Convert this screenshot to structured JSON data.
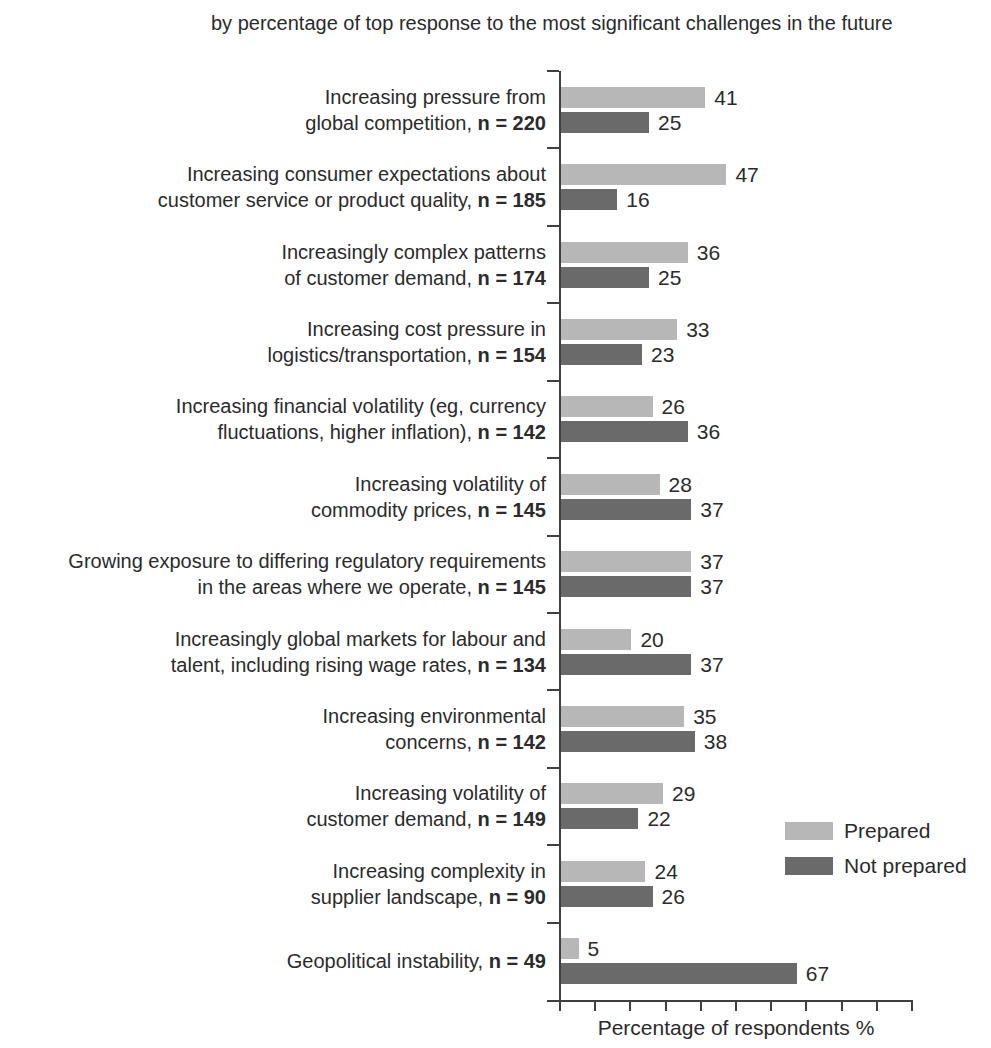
{
  "colors": {
    "axis": "#3f3f3f",
    "text": "#2b2b2b",
    "background": "#ffffff"
  },
  "chart_data": {
    "type": "bar",
    "orientation": "horizontal",
    "subtitle": "by percentage of top response to the most significant challenges in the future",
    "xlabel": "Percentage of respondents %",
    "xlim": [
      0,
      100
    ],
    "x_tick_interval": 10,
    "grid": false,
    "legend_position": "right-bottom",
    "categories": [
      "Increasing pressure from global competition, n = 220",
      "Increasing consumer expectations about customer service or product quality, n = 185",
      "Increasingly complex patterns of customer demand, n = 174",
      "Increasing cost pressure in logistics/transportation, n = 154",
      "Increasing financial volatility (eg, currency fluctuations, higher inflation), n = 142",
      "Increasing volatility of commodity prices, n = 145",
      "Growing exposure to differing regulatory requirements in the areas where we operate, n = 145",
      "Increasingly global markets for labour and talent, including rising wage rates, n = 134",
      "Increasing environmental concerns, n = 142",
      "Increasing volatility of customer demand, n = 149",
      "Increasing complexity in supplier landscape, n = 90",
      "Geopolitical instability, n = 49"
    ],
    "category_lines": [
      {
        "lines": [
          "Increasing pressure from",
          "global competition,"
        ],
        "n": "n = 220"
      },
      {
        "lines": [
          "Increasing consumer expectations about",
          "customer service or product quality,"
        ],
        "n": "n = 185"
      },
      {
        "lines": [
          "Increasingly complex patterns",
          "of customer demand,"
        ],
        "n": "n = 174"
      },
      {
        "lines": [
          "Increasing cost pressure in",
          "logistics/transportation,"
        ],
        "n": "n = 154"
      },
      {
        "lines": [
          "Increasing financial volatility (eg, currency",
          "fluctuations, higher inflation),"
        ],
        "n": "n = 142"
      },
      {
        "lines": [
          "Increasing volatility of",
          "commodity prices,"
        ],
        "n": "n = 145"
      },
      {
        "lines": [
          "Growing exposure to differing regulatory requirements",
          "in the areas where we operate,"
        ],
        "n": "n = 145"
      },
      {
        "lines": [
          "Increasingly global markets for labour and",
          "talent, including rising wage rates,"
        ],
        "n": "n = 134"
      },
      {
        "lines": [
          "Increasing environmental",
          "concerns,"
        ],
        "n": "n = 142"
      },
      {
        "lines": [
          "Increasing volatility of",
          "customer demand,"
        ],
        "n": "n = 149"
      },
      {
        "lines": [
          "Increasing complexity in",
          "supplier landscape,"
        ],
        "n": "n = 90"
      },
      {
        "lines": [
          "Geopolitical instability,"
        ],
        "n": "n = 49"
      }
    ],
    "series": [
      {
        "name": "Prepared",
        "color": "#b7b7b7",
        "values": [
          41,
          47,
          36,
          33,
          26,
          28,
          37,
          20,
          35,
          29,
          24,
          5
        ]
      },
      {
        "name": "Not prepared",
        "color": "#6a6a6a",
        "values": [
          25,
          16,
          25,
          23,
          36,
          37,
          37,
          37,
          38,
          22,
          26,
          67
        ]
      }
    ]
  }
}
